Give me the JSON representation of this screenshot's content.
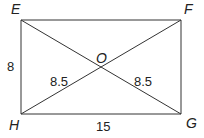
{
  "figure": {
    "type": "rectangle-with-diagonals",
    "stroke_color": "#333333",
    "background": "#ffffff",
    "vertices": {
      "E": {
        "label": "E",
        "x": 21,
        "y": 20
      },
      "F": {
        "label": "F",
        "x": 181,
        "y": 20
      },
      "G": {
        "label": "G",
        "x": 181,
        "y": 114
      },
      "H": {
        "label": "H",
        "x": 21,
        "y": 114
      },
      "O": {
        "label": "O",
        "x": 101,
        "y": 67
      }
    },
    "measurements": {
      "side_EH": "8",
      "side_HG": "15",
      "segment_HO": "8.5",
      "segment_OG": "8.5"
    }
  }
}
